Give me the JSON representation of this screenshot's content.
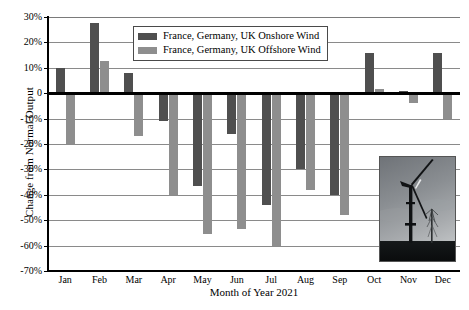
{
  "chart_data": {
    "type": "bar",
    "title": "",
    "xlabel": "Month of Year 2021",
    "ylabel": "Change from Normal Output",
    "categories": [
      "Jan",
      "Feb",
      "Mar",
      "Apr",
      "May",
      "Jun",
      "Jul",
      "Aug",
      "Sep",
      "Oct",
      "Nov",
      "Dec"
    ],
    "series": [
      {
        "name": "France, Germany, UK Onshore Wind",
        "color": "#4f4f4f",
        "values": [
          10,
          27.5,
          8,
          -11,
          -36.5,
          -16,
          -44,
          -30,
          -40,
          16,
          1,
          16
        ]
      },
      {
        "name": "France, Germany, UK Offshore Wind",
        "color": "#8e8e8e",
        "values": [
          -20,
          12.5,
          -17,
          -40,
          -55.5,
          -53.5,
          -60,
          -38,
          -48,
          1.5,
          -4,
          -10
        ]
      }
    ],
    "ylim": [
      -70,
      30
    ],
    "yticks": [
      30,
      20,
      10,
      0,
      -10,
      -20,
      -30,
      -40,
      -50,
      -60,
      -70
    ],
    "ytick_labels": [
      "30%",
      "20%",
      "10%",
      "0",
      "-10%",
      "-20%",
      "-30%",
      "-40%",
      "-50%",
      "-60%",
      "-70%"
    ],
    "grid": true,
    "legend_position": "upper center",
    "units": "percent"
  },
  "legend": {
    "entries": [
      {
        "label": "France, Germany, UK Onshore Wind",
        "color": "#4f4f4f"
      },
      {
        "label": "France, Germany, UK Offshore Wind",
        "color": "#8e8e8e"
      }
    ]
  },
  "inset": {
    "name": "wind-turbine-photo",
    "description": "Grayscale photograph of a wind turbine"
  }
}
